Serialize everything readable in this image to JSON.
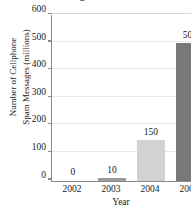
{
  "chart_data": {
    "type": "bar",
    "title": "Messages in the United States",
    "categories": [
      "2002",
      "2003",
      "2004",
      "2005"
    ],
    "values": [
      0,
      10,
      150,
      500
    ],
    "value_labels": [
      "0",
      "10",
      "150",
      "500"
    ],
    "xlabel": "Year",
    "ylabel_line1": "Number of Cellphone",
    "ylabel_line2": "Spam Messages (millions)",
    "ylim": [
      0,
      600
    ],
    "yticks": [
      0,
      100,
      200,
      300,
      400,
      500,
      600
    ],
    "ytick_labels": [
      "0",
      "100",
      "200",
      "300",
      "400",
      "500",
      "600"
    ],
    "grid": true,
    "legend": "none",
    "bar_colors": [
      "#ffffff",
      "#9a9a9a",
      "#d2d2d2",
      "#787878"
    ],
    "axis_color": "#8a8a8a",
    "gridline_color": "#e9e9e9"
  }
}
